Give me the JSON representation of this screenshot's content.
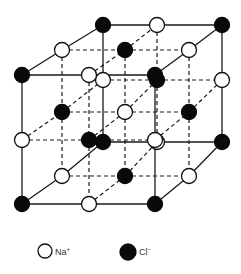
{
  "diagram": {
    "colors": {
      "na": "#ffffff",
      "cl": "#0a0a0a",
      "line": "#1a1a1a"
    },
    "atom_radius": 7.5,
    "grid": {
      "front": {
        "x": [
          22,
          89,
          155
        ],
        "y": [
          75,
          140,
          204
        ]
      },
      "middle": {
        "x": [
          62,
          125,
          189
        ],
        "y": [
          50,
          112,
          176
        ]
      },
      "back": {
        "x": [
          103,
          157,
          222
        ],
        "y": [
          25,
          80,
          142
        ]
      }
    },
    "coloring_rule": "Cl- where (i+j+k) is even, Na+ otherwise; i = left-to-right, j = top-to-bottom, k = front-to-back"
  },
  "legend": {
    "items": [
      {
        "ion": "Na",
        "charge": "+",
        "symbol": "white-circle",
        "cx": 45,
        "cy": 251,
        "r": 7,
        "label_x": 55,
        "label_y": 255
      },
      {
        "ion": "Cl",
        "charge": "−",
        "symbol": "black-circle",
        "cx": 128,
        "cy": 252,
        "r": 8,
        "label_x": 139,
        "label_y": 255
      }
    ]
  }
}
